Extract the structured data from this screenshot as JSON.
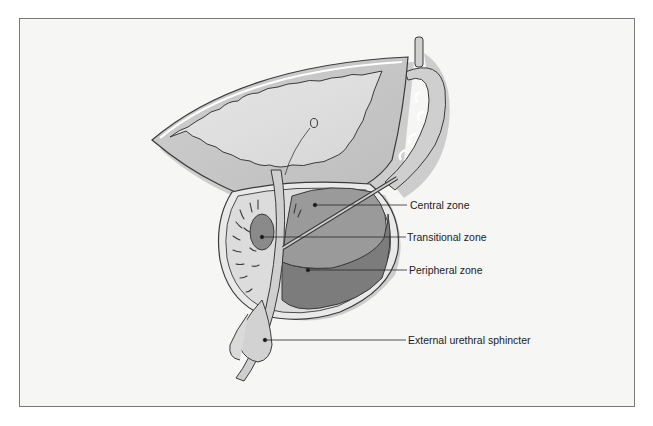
{
  "figure": {
    "labels": [
      {
        "id": "central",
        "text": "Central zone",
        "x": 410,
        "y": 199
      },
      {
        "id": "transitional",
        "text": "Transitional zone",
        "x": 407,
        "y": 231
      },
      {
        "id": "peripheral",
        "text": "Peripheral zone",
        "x": 409,
        "y": 264
      },
      {
        "id": "sphincter",
        "text": "External urethral sphincter",
        "x": 408,
        "y": 334
      }
    ],
    "colors": {
      "background": "#f6f6f5",
      "frame_border": "#7a7a7a",
      "bladder_fill": "#d4d4d4",
      "bladder_lumen": "#e2e2e2",
      "central_zone": "#9a9a9a",
      "transitional_zone": "#8a8a8a",
      "peripheral_zone": "#7c7c7c",
      "gland_light": "#dedede",
      "outline": "#3a3a3a",
      "shadow": "#b9b9b9"
    }
  }
}
